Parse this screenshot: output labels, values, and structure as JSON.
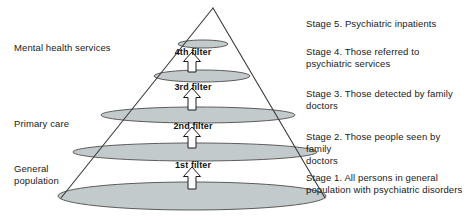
{
  "figure": {
    "title_present": false,
    "background": "#ffffff",
    "ellipse_fill": "#c3cacb",
    "ellipse_stroke": "#4d4d4d",
    "cone_stroke": "#3a3a3a",
    "arrow_fill": "#ffffff",
    "arrow_stroke": "#1a1a1a"
  },
  "left_labels": [
    {
      "id": "mental-health-services",
      "text": "Mental health services",
      "x": 14,
      "y": 42
    },
    {
      "id": "primary-care",
      "text": "Primary care",
      "x": 14,
      "y": 118
    },
    {
      "id": "general-population",
      "text": "General\npopulation",
      "x": 14,
      "y": 163
    }
  ],
  "right_labels": [
    {
      "id": "stage-5",
      "text": "Stage 5. Psychiatric inpatients",
      "x": 306,
      "y": 18
    },
    {
      "id": "stage-4",
      "text": "Stage 4. Those referred to\npsychiatric services",
      "x": 306,
      "y": 46
    },
    {
      "id": "stage-3",
      "text": "Stage 3. Those detected by family\ndoctors",
      "x": 306,
      "y": 88
    },
    {
      "id": "stage-2",
      "text": "Stage 2. Those people seen by family\ndoctors",
      "x": 306,
      "y": 131
    },
    {
      "id": "stage-1",
      "text": "Stage 1. All persons in general\npopulation with psychiatric disorders",
      "x": 306,
      "y": 172
    }
  ],
  "filters": [
    {
      "id": "filter-4",
      "label": "4th filter",
      "x": 148,
      "y": 47
    },
    {
      "id": "filter-3",
      "label": "3rd filter",
      "x": 148,
      "y": 82
    },
    {
      "id": "filter-2",
      "label": "2nd filter",
      "x": 148,
      "y": 121
    },
    {
      "id": "filter-1",
      "label": "1st filter",
      "x": 148,
      "y": 160
    }
  ],
  "chart_data": {
    "type": "diagram",
    "subtype": "filter-cone",
    "apex": {
      "x": 213,
      "y": 8
    },
    "base_left": {
      "x": 61,
      "y": 198
    },
    "base_right": {
      "x": 325,
      "y": 198
    },
    "levels": [
      {
        "stage": 5,
        "name": "Psychiatric inpatients",
        "cx": 203,
        "cy": 44,
        "rx": 25,
        "ry": 4
      },
      {
        "stage": 4,
        "name": "Those referred to psychiatric services",
        "cx": 202,
        "cy": 76,
        "rx": 48,
        "ry": 6
      },
      {
        "stage": 3,
        "name": "Those detected by family doctors",
        "cx": 198,
        "cy": 115,
        "rx": 97,
        "ry": 8
      },
      {
        "stage": 2,
        "name": "Those people seen by family doctors",
        "cx": 195,
        "cy": 152,
        "rx": 122,
        "ry": 9
      },
      {
        "stage": 1,
        "name": "All persons in general population with psychiatric disorders",
        "cx": 192,
        "cy": 196,
        "rx": 134,
        "ry": 14
      }
    ],
    "arrows": [
      {
        "id": "arrow-4",
        "label": "4th filter",
        "cx": 192,
        "tip_y": 52,
        "tail_y": 72
      },
      {
        "id": "arrow-3",
        "label": "3rd filter",
        "cx": 192,
        "tip_y": 88,
        "tail_y": 110
      },
      {
        "id": "arrow-2",
        "label": "2nd filter",
        "cx": 192,
        "tip_y": 127,
        "tail_y": 148
      },
      {
        "id": "arrow-1",
        "label": "1st filter",
        "cx": 192,
        "tip_y": 167,
        "tail_y": 189
      }
    ],
    "care_tiers": [
      "Mental health services",
      "Primary care",
      "General population"
    ]
  }
}
